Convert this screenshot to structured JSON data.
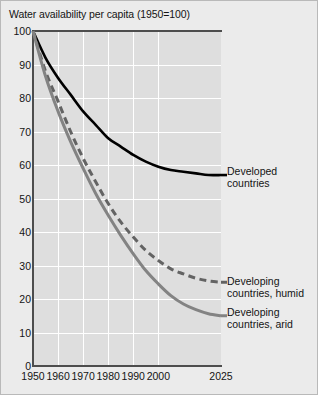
{
  "chart_data": {
    "type": "line",
    "title": "Water availability per capita (1950=100)",
    "xlabel": "",
    "ylabel": "",
    "xlim": [
      1950,
      2025
    ],
    "ylim": [
      0,
      100
    ],
    "grid": true,
    "legend_position": "right-inline",
    "x_ticks": [
      "1950",
      "1960",
      "1970",
      "1980",
      "1990",
      "2000",
      "2025"
    ],
    "x_tick_values": [
      1950,
      1960,
      1970,
      1980,
      1990,
      2000,
      2025
    ],
    "y_ticks": [
      "0",
      "10",
      "20",
      "30",
      "40",
      "50",
      "60",
      "70",
      "80",
      "90",
      "100"
    ],
    "y_tick_values": [
      0,
      10,
      20,
      30,
      40,
      50,
      60,
      70,
      80,
      90,
      100
    ],
    "x": [
      1950,
      1955,
      1960,
      1965,
      1970,
      1975,
      1980,
      1985,
      1990,
      1995,
      2000,
      2005,
      2010,
      2015,
      2020,
      2025
    ],
    "series": [
      {
        "name": "Developed countries",
        "label_line1": "Developed",
        "label_line2": "countries",
        "style": "solid",
        "color": "#000000",
        "width": 2.6,
        "values": [
          100,
          92,
          86,
          81,
          76,
          72,
          68,
          65.5,
          63,
          61,
          59.5,
          58.5,
          58,
          57.5,
          57,
          57
        ]
      },
      {
        "name": "Developing countries, humid",
        "label_line1": "Developing",
        "label_line2": "countries, humid",
        "style": "dashed",
        "color": "#636363",
        "width": 3.0,
        "values": [
          100,
          88,
          79,
          70,
          62,
          55,
          48.5,
          43,
          38.5,
          34.5,
          31.5,
          29,
          27.5,
          26.2,
          25.4,
          25
        ]
      },
      {
        "name": "Developing countries, arid",
        "label_line1": "Developing",
        "label_line2": "countries, arid",
        "style": "solid",
        "color": "#838383",
        "width": 3.0,
        "values": [
          100,
          86.5,
          76,
          67,
          59,
          51.5,
          45,
          39,
          33.5,
          28.5,
          24.5,
          21,
          18.5,
          16.8,
          15.6,
          15
        ]
      }
    ],
    "annotations": []
  },
  "labels": {
    "developed": {
      "line1": "Developed",
      "line2": "countries"
    },
    "humid": {
      "line1": "Developing",
      "line2": "countries, humid"
    },
    "arid": {
      "line1": "Developing",
      "line2": "countries, arid"
    }
  },
  "colors": {
    "figure_background": "#ebebeb",
    "plot_background": "#dedede",
    "gridline": "#ffffff",
    "axis": "#4d4d4d",
    "text": "#141414",
    "developed": "#000000",
    "humid": "#636363",
    "arid": "#838383"
  }
}
